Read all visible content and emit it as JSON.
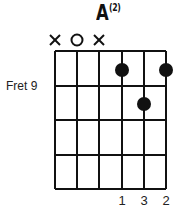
{
  "chord": {
    "name": "A",
    "variant": "(2)",
    "fret_label": "Fret 9",
    "strings": 6,
    "frets_shown": 4,
    "string_markers": [
      "x",
      "o",
      "x",
      "",
      "",
      ""
    ],
    "dots": [
      {
        "string": 4,
        "fret": 1
      },
      {
        "string": 6,
        "fret": 1
      },
      {
        "string": 5,
        "fret": 2
      }
    ],
    "fingers": [
      "",
      "",
      "",
      "1",
      "3",
      "2"
    ]
  }
}
